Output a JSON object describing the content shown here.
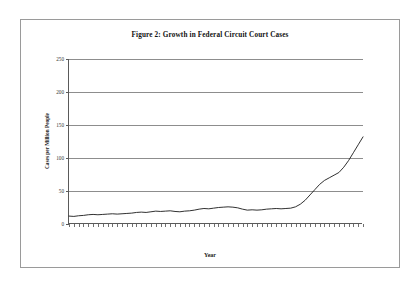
{
  "document": {
    "border_color": "#9a9a9a",
    "background": "#ffffff"
  },
  "chart_data": {
    "type": "line",
    "title": "Figure 2: Growth in Federal Circuit Court Cases",
    "xlabel": "Year",
    "ylabel": "Cases per Million People",
    "xlim": [
      1941,
      2002
    ],
    "ylim": [
      0,
      250
    ],
    "yticks": [
      0,
      50,
      100,
      150,
      200,
      250
    ],
    "ytick_labels": [
      "0",
      "50",
      "100",
      "150",
      "200",
      "250"
    ],
    "xtick_labels": [
      "1941",
      "1945",
      "1949",
      "1953",
      "1957",
      "1961",
      "1965",
      "1969",
      "1973",
      "1977",
      "1981",
      "1985",
      "1989",
      "1993",
      "1997",
      "2001"
    ],
    "grid": "horizontal",
    "legend": "none",
    "line_color": "#1a1a1a",
    "series_name": "Cases per Million People",
    "x": [
      1941,
      1942,
      1943,
      1944,
      1945,
      1946,
      1947,
      1948,
      1949,
      1950,
      1951,
      1952,
      1953,
      1954,
      1955,
      1956,
      1957,
      1958,
      1959,
      1960,
      1961,
      1962,
      1963,
      1964,
      1965,
      1966,
      1967,
      1968,
      1969,
      1970,
      1971,
      1972,
      1973,
      1974,
      1975,
      1976,
      1977,
      1978,
      1979,
      1980,
      1981,
      1982,
      1983,
      1984,
      1985,
      1986,
      1987,
      1988,
      1989,
      1990,
      1991,
      1992,
      1993,
      1994,
      1995,
      1996,
      1997,
      1998,
      1999,
      2000,
      2001,
      2002
    ],
    "values": [
      12,
      11.5,
      12.5,
      13,
      14,
      14.5,
      14,
      14.5,
      15,
      15.5,
      15,
      15.5,
      16,
      16.5,
      17.5,
      18,
      17.5,
      18.5,
      19.5,
      19,
      19.5,
      20,
      19,
      18.5,
      19.5,
      20,
      21,
      22.5,
      23.5,
      23,
      24,
      25,
      25.5,
      26,
      25.5,
      24.5,
      22.5,
      21,
      21.5,
      21,
      21.5,
      22.5,
      23,
      23.5,
      23,
      23.5,
      24,
      26,
      30,
      36,
      44,
      52,
      60,
      66,
      70,
      74,
      78,
      86,
      96,
      108,
      120,
      132
    ]
  }
}
